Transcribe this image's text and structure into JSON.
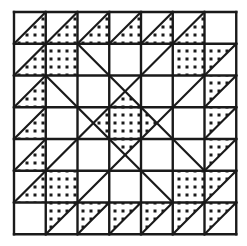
{
  "title": "Quilt block pattern",
  "colors": {
    "line": "#1a1a1a",
    "background": "#ffffff",
    "fill_bg": "#ffffff",
    "dot": "#1a1a1a"
  },
  "grid": {
    "x0": 14,
    "y0": 12,
    "cell": 31.75,
    "size": 7
  },
  "cells": [
    {
      "r": 0,
      "c": 0,
      "t": "tri-lr"
    },
    {
      "r": 0,
      "c": 1,
      "t": "tri-lr"
    },
    {
      "r": 0,
      "c": 2,
      "t": "tri-lr"
    },
    {
      "r": 0,
      "c": 3,
      "t": "tri-lr"
    },
    {
      "r": 0,
      "c": 4,
      "t": "tri-lr"
    },
    {
      "r": 0,
      "c": 5,
      "t": "tri-lr"
    },
    {
      "r": 0,
      "c": 6,
      "t": "blank"
    },
    {
      "r": 1,
      "c": 0,
      "t": "tri-lr"
    },
    {
      "r": 1,
      "c": 1,
      "t": "full"
    },
    {
      "r": 1,
      "c": 5,
      "t": "full"
    },
    {
      "r": 1,
      "c": 6,
      "t": "tri-ul"
    },
    {
      "r": 2,
      "c": 0,
      "t": "tri-lr"
    },
    {
      "r": 2,
      "c": 6,
      "t": "tri-ul"
    },
    {
      "r": 3,
      "c": 0,
      "t": "tri-lr"
    },
    {
      "r": 3,
      "c": 3,
      "t": "full"
    },
    {
      "r": 3,
      "c": 6,
      "t": "tri-ul"
    },
    {
      "r": 4,
      "c": 0,
      "t": "tri-lr"
    },
    {
      "r": 4,
      "c": 6,
      "t": "tri-ul"
    },
    {
      "r": 5,
      "c": 0,
      "t": "tri-lr"
    },
    {
      "r": 5,
      "c": 1,
      "t": "full"
    },
    {
      "r": 5,
      "c": 5,
      "t": "full"
    },
    {
      "r": 5,
      "c": 6,
      "t": "tri-ul"
    },
    {
      "r": 6,
      "c": 0,
      "t": "blank"
    },
    {
      "r": 6,
      "c": 1,
      "t": "tri-ul"
    },
    {
      "r": 6,
      "c": 2,
      "t": "tri-ul"
    },
    {
      "r": 6,
      "c": 3,
      "t": "tri-ul"
    },
    {
      "r": 6,
      "c": 4,
      "t": "tri-ul"
    },
    {
      "r": 6,
      "c": 5,
      "t": "tri-ul"
    },
    {
      "r": 6,
      "c": 6,
      "t": "tri-ul"
    }
  ],
  "diamond": [
    [
      3.5,
      2.5
    ],
    [
      4.5,
      3.5
    ],
    [
      3.5,
      4.5
    ],
    [
      2.5,
      3.5
    ]
  ],
  "lines": [
    [
      [
        2,
        1
      ],
      [
        6,
        5
      ]
    ],
    [
      [
        5,
        1
      ],
      [
        1,
        5
      ]
    ],
    [
      [
        1,
        2
      ],
      [
        5,
        6
      ]
    ],
    [
      [
        6,
        2
      ],
      [
        2,
        6
      ]
    ]
  ]
}
